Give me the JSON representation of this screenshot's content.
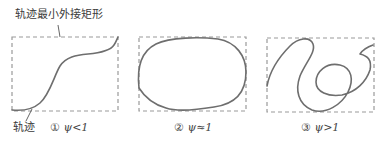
{
  "annotations": {
    "bounding_rect_label": "轨迹最小外接矩形",
    "trajectory_label": "轨迹"
  },
  "panels": [
    {
      "index": "①",
      "caption": "ψ<1",
      "shape": "s-curve"
    },
    {
      "index": "②",
      "caption": "ψ≈1",
      "shape": "closed-loop"
    },
    {
      "index": "③",
      "caption": "ψ>1",
      "shape": "looping-curve"
    }
  ],
  "colors": {
    "rect_stroke": "#9a9a9a",
    "curve_stroke": "#6e6e6e",
    "text": "#3a3a3a"
  }
}
